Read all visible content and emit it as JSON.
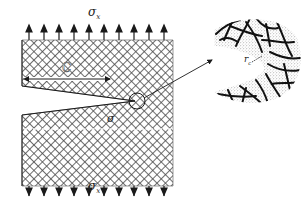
{
  "figure": {
    "type": "fracture-mechanics diagram",
    "specimen": {
      "description": "Plate with edge crack under uniaxial tension",
      "top_stress_label": "σ",
      "top_stress_subscript": "x",
      "bottom_stress_label": "σ",
      "bottom_stress_subscript": "x",
      "crack_length_label": "C",
      "local_stress_label": "σ",
      "top_arrow_count": 10,
      "bottom_arrow_count": 10
    },
    "magnified_view": {
      "description": "Crack tip region with fiber network and process zone",
      "tip_radius_label": "r",
      "tip_radius_subscript": "c"
    },
    "colors": {
      "ink": "#1a1a1a",
      "hatch": "#555555",
      "stipple": "#888888",
      "background": "#ffffff"
    }
  }
}
